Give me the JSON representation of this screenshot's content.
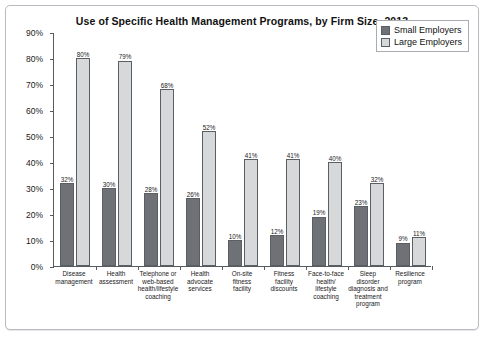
{
  "chart_data": {
    "type": "bar",
    "title": "Use of Specific Health Management Programs, by Firm Size, 2013",
    "xlabel": "",
    "ylabel": "",
    "ylim": [
      0,
      90
    ],
    "ytick_labels": [
      "90%",
      "80%",
      "70%",
      "60%",
      "50%",
      "40%",
      "30%",
      "20%",
      "10%",
      "0%"
    ],
    "ytick_values": [
      90,
      80,
      70,
      60,
      50,
      40,
      30,
      20,
      10,
      0
    ],
    "grid": false,
    "legend_position": "top-right",
    "categories": [
      "Disease management",
      "Health assessment",
      "Telephone or web-based health/lifestyle coaching",
      "Health advocate services",
      "On-site fitness facility",
      "Fitness facility discounts",
      "Face-to-face health/ lifestyle coaching",
      "Sleep disorder diagnosis and treatment program",
      "Resilience program"
    ],
    "category_lines": [
      [
        "Disease",
        "management"
      ],
      [
        "Health",
        "assessment"
      ],
      [
        "Telephone or",
        "web-based",
        "health/lifestyle",
        "coaching"
      ],
      [
        "Health",
        "advocate",
        "services"
      ],
      [
        "On-site",
        "fitness",
        "facility"
      ],
      [
        "Fitness",
        "facility",
        "discounts"
      ],
      [
        "Face-to-face",
        "health/",
        "lifestyle",
        "coaching"
      ],
      [
        "Sleep",
        "disorder",
        "diagnosis and",
        "treatment",
        "program"
      ],
      [
        "Resilience",
        "program"
      ]
    ],
    "series": [
      {
        "name": "Small Employers",
        "color": "#6e7276",
        "values": [
          32,
          30,
          28,
          26,
          10,
          12,
          19,
          23,
          9
        ],
        "labels": [
          "32%",
          "30%",
          "28%",
          "26%",
          "10%",
          "12%",
          "19%",
          "23%",
          "9%"
        ]
      },
      {
        "name": "Large Employers",
        "color": "#d6d8da",
        "values": [
          80,
          79,
          68,
          52,
          41,
          41,
          40,
          32,
          11
        ],
        "labels": [
          "80%",
          "79%",
          "68%",
          "52%",
          "41%",
          "41%",
          "40%",
          "32%",
          "11%"
        ]
      }
    ]
  }
}
